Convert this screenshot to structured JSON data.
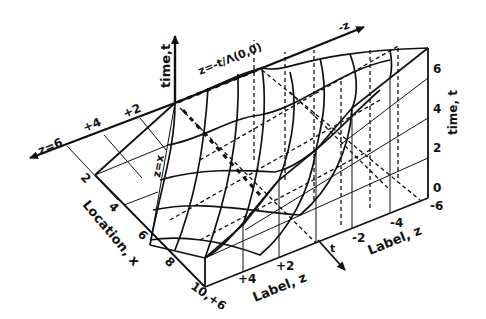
{
  "diagram": {
    "type": "3d-surface-wireframe",
    "axes": {
      "time": {
        "label": "time,t",
        "right_label": "time, t",
        "ticks": [
          "0",
          "2",
          "4",
          "6"
        ]
      },
      "location": {
        "label": "Location, x",
        "ticks": [
          "2",
          "4",
          "6",
          "8",
          "10"
        ]
      },
      "z_front": {
        "label": "Label, z",
        "ticks": [
          "+6",
          "+4",
          "+2"
        ]
      },
      "z_right": {
        "label": "Label, z",
        "ticks": [
          "-2",
          "-4",
          "-6"
        ]
      },
      "z_top": {
        "left_label": "z=6",
        "ticks": [
          "+4",
          "+2"
        ],
        "arrow_label": "-z"
      }
    },
    "annotations": {
      "characteristic_top": "z=-t/Λ(0,0)",
      "characteristic_diag": "z=x",
      "front_arrow": "t"
    },
    "corner_label": "10,+6",
    "colors": {
      "ink": "#111111",
      "background": "#ffffff"
    }
  }
}
